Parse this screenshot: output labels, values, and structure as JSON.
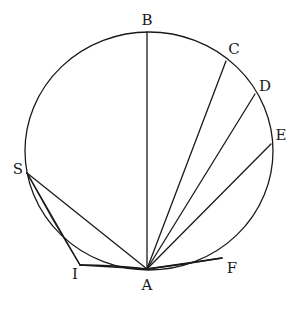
{
  "figure": {
    "circle": {
      "cx": 149,
      "cy": 151,
      "rx": 124,
      "ry": 119
    },
    "points": {
      "A": {
        "label": "A",
        "x": 147,
        "y": 269,
        "lx": 147,
        "ly": 286
      },
      "B": {
        "label": "B",
        "x": 147,
        "y": 32,
        "lx": 147,
        "ly": 21
      },
      "C": {
        "label": "C",
        "x": 226,
        "y": 61,
        "lx": 234,
        "ly": 50
      },
      "D": {
        "label": "D",
        "x": 255,
        "y": 94,
        "lx": 265,
        "ly": 87
      },
      "E": {
        "label": "E",
        "x": 271,
        "y": 144,
        "lx": 281,
        "ly": 136
      },
      "F": {
        "label": "F",
        "x": 222,
        "y": 258,
        "lx": 232,
        "ly": 269
      },
      "I": {
        "label": "I",
        "x": 80,
        "y": 265,
        "lx": 75,
        "ly": 275
      },
      "S": {
        "label": "S",
        "x": 27,
        "y": 173,
        "lx": 18,
        "ly": 170
      }
    },
    "chords": [
      [
        "A",
        "B"
      ],
      [
        "A",
        "C"
      ],
      [
        "A",
        "D"
      ],
      [
        "A",
        "E"
      ],
      [
        "A",
        "F"
      ],
      [
        "A",
        "S"
      ],
      [
        "A",
        "I"
      ],
      [
        "S",
        "I"
      ]
    ],
    "arcs": [
      {
        "from": "A",
        "to": "F",
        "bulge": "inner"
      },
      {
        "from": "S",
        "to": "I",
        "bulge": "inner"
      },
      {
        "from": "I",
        "to": "A",
        "bulge": "inner"
      }
    ],
    "color": "#1a1a1a"
  }
}
